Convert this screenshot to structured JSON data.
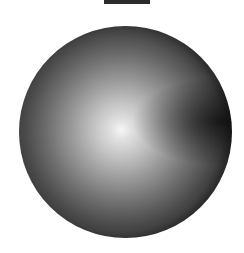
{
  "image": {
    "description": "Grayscale shaded sphere rendering with a bright highlight near center and a dark top bar",
    "colors": {
      "background": "#ffffff",
      "top_bar": "#2b2b2b",
      "sphere_highlight": "#f6f6f6",
      "sphere_mid": "#8a8a8a",
      "sphere_edge": "#2a2a2a"
    }
  }
}
